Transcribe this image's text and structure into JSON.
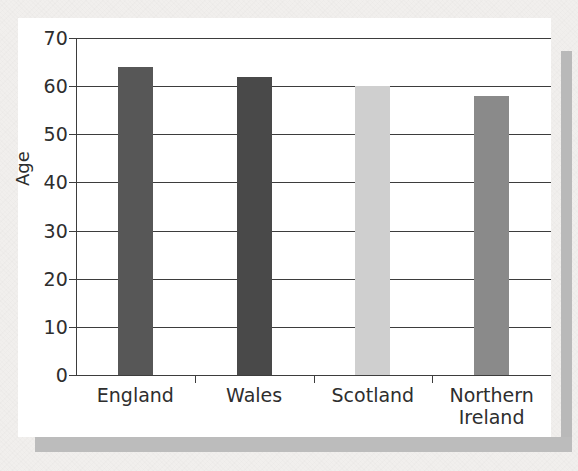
{
  "figure": {
    "background_color": "#f1efed",
    "card_color": "#ffffff",
    "shadow_color": "#bcbcbc",
    "axis_color": "#3d3d3d"
  },
  "chart_data": {
    "type": "bar",
    "title": "",
    "xlabel": "",
    "ylabel": "Age",
    "ylim": [
      0,
      70
    ],
    "ytick_values": [
      0,
      10,
      20,
      30,
      40,
      50,
      60,
      70
    ],
    "ytick_labels": [
      "0",
      "10",
      "20",
      "30",
      "40",
      "50",
      "60",
      "70"
    ],
    "grid": "horizontal",
    "legend": "none",
    "categories": [
      "England",
      "Wales",
      "Scotland",
      "Northern\nIreland"
    ],
    "values": [
      64,
      62,
      60,
      58
    ],
    "bar_colors": [
      "#575757",
      "#494949",
      "#cfcfcf",
      "#8a8a8a"
    ],
    "bars": [
      {
        "label": "England",
        "value": 64,
        "color": "#575757"
      },
      {
        "label": "Wales",
        "value": 62,
        "color": "#494949"
      },
      {
        "label": "Scotland",
        "value": 60,
        "color": "#cfcfcf"
      },
      {
        "label": "Northern\nIreland",
        "value": 58,
        "color": "#8a8a8a"
      }
    ]
  }
}
